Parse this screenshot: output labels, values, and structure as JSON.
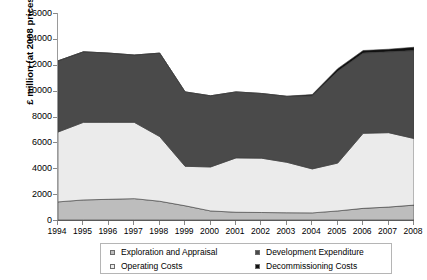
{
  "chart_data": {
    "type": "area",
    "stacked": true,
    "title": "",
    "xlabel": "",
    "ylabel": "£ million (at 2008 prices)",
    "categories": [
      "1994",
      "1995",
      "1996",
      "1997",
      "1998",
      "1999",
      "2000",
      "2001",
      "2002",
      "2003",
      "2004",
      "2005",
      "2006",
      "2007",
      "2008"
    ],
    "ylim": [
      0,
      16000
    ],
    "ytick_step": 2000,
    "yticks": [
      "0",
      "2000",
      "4000",
      "6000",
      "8000",
      "10000",
      "12000",
      "14000",
      "16000"
    ],
    "grid": false,
    "legend_position": "bottom",
    "series": [
      {
        "name": "Exploration and Appraisal",
        "color": "#bdbdbd",
        "values": [
          1400,
          1550,
          1600,
          1650,
          1450,
          1100,
          700,
          600,
          580,
          560,
          550,
          700,
          900,
          1000,
          1150
        ]
      },
      {
        "name": "Operating Costs",
        "color": "#ebebeb",
        "values": [
          5400,
          6000,
          5950,
          5900,
          5000,
          3050,
          3400,
          4200,
          4200,
          3900,
          3400,
          3700,
          5800,
          5750,
          5150
        ]
      },
      {
        "name": "Development Expenditure",
        "color": "#4a4a4a",
        "values": [
          5500,
          5450,
          5350,
          5200,
          6450,
          5750,
          5500,
          5100,
          5000,
          5100,
          5650,
          7100,
          6200,
          6250,
          6800
        ]
      },
      {
        "name": "Decommissioning Costs",
        "color": "#101010",
        "values": [
          0,
          0,
          0,
          0,
          0,
          0,
          0,
          0,
          0,
          0,
          100,
          200,
          200,
          200,
          250
        ]
      }
    ],
    "totals": [
      12300,
      13000,
      12900,
      12750,
      12900,
      9900,
      9600,
      9900,
      9780,
      9560,
      9700,
      11700,
      13100,
      13200,
      13350
    ]
  },
  "legend": {
    "items": [
      {
        "label": "Exploration and Appraisal",
        "swatch_icon": "square-swatch-icon"
      },
      {
        "label": "Development Expenditure",
        "swatch_icon": "square-swatch-icon"
      },
      {
        "label": "Operating Costs",
        "swatch_icon": "square-swatch-icon"
      },
      {
        "label": "Decommissioning Costs",
        "swatch_icon": "square-swatch-icon"
      }
    ],
    "order": [
      0,
      2,
      1,
      3
    ]
  }
}
